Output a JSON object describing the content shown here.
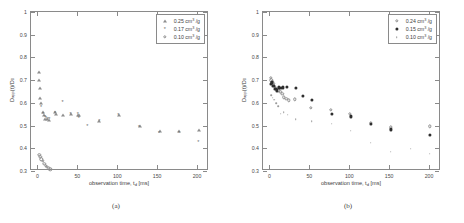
{
  "figure": {
    "panels": [
      {
        "id": "a",
        "caption": "(a)",
        "legend": [
          {
            "marker": "triangle",
            "label": "0.25 cm³ /g",
            "value": 0.25
          },
          {
            "marker": "star",
            "label": "0.17 cm³ /g",
            "value": 0.17
          },
          {
            "marker": "circle",
            "label": "0.10 cm³ /g",
            "value": 0.1
          }
        ]
      },
      {
        "id": "b",
        "caption": "(b)",
        "legend": [
          {
            "marker": "circle",
            "label": "0.24 cm³ /g",
            "value": 0.24
          },
          {
            "marker": "filled",
            "label": "0.15 cm³ /g",
            "value": 0.15
          },
          {
            "marker": "dot",
            "label": "0.10 cm³ /g",
            "value": 0.1
          }
        ]
      }
    ],
    "axis": {
      "xlabel_pre": "observation time, t",
      "xlabel_sub": "d",
      "xlabel_post": " [ms]",
      "ylabel_pre": "D",
      "ylabel_sub1": "app",
      "ylabel_mid": "(t)/D",
      "ylabel_sub2": "0",
      "xticks": [
        0,
        50,
        100,
        150,
        200
      ],
      "yticks": [
        0.3,
        0.4,
        0.5,
        0.6,
        0.7,
        0.8,
        0.9,
        1
      ],
      "ytick_labels": [
        "0.3",
        "0.4",
        "0.5",
        "0.6",
        "0.7",
        "0.8",
        "0.9",
        "1"
      ],
      "xlim": [
        -8,
        215
      ],
      "ylim": [
        0.3,
        1.0
      ]
    }
  },
  "chart_data": [
    {
      "type": "scatter",
      "panel": "a",
      "title": "",
      "xlabel": "observation time, t_d [ms]",
      "ylabel": "D_app(t)/D_0",
      "xlim": [
        -8,
        215
      ],
      "ylim": [
        0.3,
        1.0
      ],
      "grid": false,
      "legend_position": "upper right",
      "series": [
        {
          "name": "0.25 cm^3 /g",
          "marker": "triangle",
          "points": [
            [
              2.0,
              0.735
            ],
            [
              2.5,
              0.7
            ],
            [
              3.0,
              0.665
            ],
            [
              3.5,
              0.62
            ],
            [
              5.0,
              0.6
            ],
            [
              6.5,
              0.56
            ],
            [
              8.0,
              0.545
            ],
            [
              10.0,
              0.53
            ],
            [
              12.0,
              0.528
            ],
            [
              14.0,
              0.525
            ],
            [
              21.5,
              0.558
            ],
            [
              23.0,
              0.553
            ],
            [
              32.0,
              0.548
            ],
            [
              42.0,
              0.55
            ],
            [
              51.0,
              0.548
            ],
            [
              52.5,
              0.545
            ],
            [
              77.0,
              0.52
            ],
            [
              102.0,
              0.548
            ],
            [
              128.0,
              0.497
            ],
            [
              153.0,
              0.478
            ],
            [
              177.0,
              0.478
            ],
            [
              202.0,
              0.48
            ]
          ]
        },
        {
          "name": "0.17 cm^3 /g",
          "marker": "star",
          "points": [
            [
              4.5,
              0.58
            ],
            [
              7.0,
              0.553
            ],
            [
              9.5,
              0.537
            ],
            [
              11.0,
              0.533
            ],
            [
              13.0,
              0.53
            ],
            [
              15.0,
              0.528
            ],
            [
              22.0,
              0.555
            ],
            [
              31.5,
              0.603
            ],
            [
              41.5,
              0.552
            ],
            [
              50.5,
              0.552
            ],
            [
              52.0,
              0.533
            ],
            [
              62.5,
              0.5
            ],
            [
              77.5,
              0.518
            ],
            [
              101.5,
              0.548
            ],
            [
              127.5,
              0.495
            ],
            [
              152.5,
              0.468
            ],
            [
              177.5,
              0.468
            ],
            [
              201.5,
              0.428
            ]
          ]
        },
        {
          "name": "0.10 cm^3 /g",
          "marker": "circle",
          "points": [
            [
              2.5,
              0.372
            ],
            [
              3.5,
              0.363
            ],
            [
              5.0,
              0.352
            ],
            [
              7.0,
              0.345
            ],
            [
              8.5,
              0.333
            ],
            [
              10.5,
              0.323
            ],
            [
              12.0,
              0.318
            ],
            [
              14.0,
              0.312
            ],
            [
              16.0,
              0.308
            ]
          ]
        }
      ]
    },
    {
      "type": "scatter",
      "panel": "b",
      "title": "",
      "xlabel": "observation time, t_d [ms]",
      "ylabel": "D_app(t)/D_0",
      "xlim": [
        -8,
        215
      ],
      "ylim": [
        0.3,
        1.0
      ],
      "grid": false,
      "legend_position": "upper right",
      "series": [
        {
          "name": "0.24 cm^3 /g",
          "marker": "circle",
          "points": [
            [
              1.5,
              0.71
            ],
            [
              2.5,
              0.7
            ],
            [
              3.5,
              0.69
            ],
            [
              5.0,
              0.683
            ],
            [
              7.0,
              0.67
            ],
            [
              9.0,
              0.663
            ],
            [
              11.0,
              0.655
            ],
            [
              13.5,
              0.65
            ],
            [
              16.0,
              0.64
            ],
            [
              18.0,
              0.625
            ],
            [
              21.0,
              0.618
            ],
            [
              24.0,
              0.612
            ],
            [
              32.0,
              0.615
            ],
            [
              52.0,
              0.578
            ],
            [
              77.0,
              0.57
            ],
            [
              101.0,
              0.552
            ],
            [
              127.0,
              0.512
            ],
            [
              152.0,
              0.492
            ],
            [
              201.0,
              0.497
            ]
          ]
        },
        {
          "name": "0.15 cm^3 /g",
          "marker": "filled",
          "points": [
            [
              1.5,
              0.683
            ],
            [
              3.0,
              0.69
            ],
            [
              5.0,
              0.675
            ],
            [
              7.5,
              0.66
            ],
            [
              9.5,
              0.655
            ],
            [
              12.0,
              0.668
            ],
            [
              14.0,
              0.665
            ],
            [
              17.0,
              0.668
            ],
            [
              22.0,
              0.672
            ],
            [
              33.0,
              0.665
            ],
            [
              42.0,
              0.63
            ],
            [
              53.0,
              0.612
            ],
            [
              78.0,
              0.553
            ],
            [
              102.0,
              0.54
            ],
            [
              127.5,
              0.508
            ],
            [
              152.0,
              0.483
            ],
            [
              201.5,
              0.458
            ]
          ]
        },
        {
          "name": "0.10 cm^3 /g",
          "marker": "dot",
          "points": [
            [
              2.0,
              0.635
            ],
            [
              4.0,
              0.622
            ],
            [
              6.0,
              0.613
            ],
            [
              8.5,
              0.598
            ],
            [
              11.0,
              0.585
            ],
            [
              14.0,
              0.553
            ],
            [
              18.0,
              0.56
            ],
            [
              23.0,
              0.548
            ],
            [
              33.0,
              0.528
            ],
            [
              53.0,
              0.518
            ],
            [
              78.0,
              0.508
            ],
            [
              102.0,
              0.477
            ],
            [
              127.0,
              0.425
            ],
            [
              152.0,
              0.385
            ],
            [
              177.0,
              0.398
            ],
            [
              201.0,
              0.377
            ]
          ]
        }
      ]
    }
  ]
}
